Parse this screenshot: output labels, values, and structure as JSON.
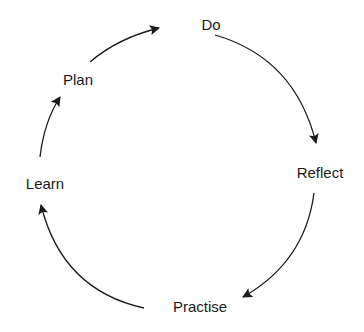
{
  "diagram": {
    "title": "",
    "type": "cycle",
    "nodes": [
      {
        "id": "do",
        "label": "Do",
        "x": 211,
        "y": 24
      },
      {
        "id": "reflect",
        "label": "Reflect",
        "x": 320,
        "y": 172
      },
      {
        "id": "practise",
        "label": "Practise",
        "x": 200,
        "y": 306
      },
      {
        "id": "learn",
        "label": "Learn",
        "x": 45,
        "y": 183
      },
      {
        "id": "plan",
        "label": "Plan",
        "x": 78,
        "y": 79
      }
    ],
    "edges": [
      {
        "from": "plan",
        "to": "do"
      },
      {
        "from": "do",
        "to": "reflect"
      },
      {
        "from": "reflect",
        "to": "practise"
      },
      {
        "from": "practise",
        "to": "learn"
      },
      {
        "from": "learn",
        "to": "plan"
      }
    ],
    "colors": {
      "stroke": "#1a1a1a",
      "text": "#1a1a1a",
      "background": "#ffffff"
    }
  }
}
